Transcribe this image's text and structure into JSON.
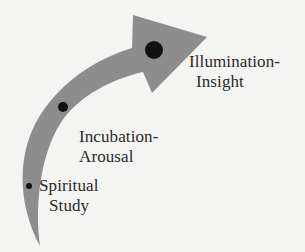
{
  "diagram": {
    "arrow": {
      "fill_color": "#8d8d8d",
      "direction": "curving up and to the right"
    },
    "stages": [
      {
        "label_line1": "Spiritual",
        "label_line2": "Study",
        "dot_size": "small"
      },
      {
        "label_line1": "Incubation-",
        "label_line2": "Arousal",
        "dot_size": "medium"
      },
      {
        "label_line1": "Illumination-",
        "label_line2": "Insight",
        "dot_size": "large"
      }
    ],
    "colors": {
      "background": "#f4f4f2",
      "arrow": "#8d8d8d",
      "dot": "#111111",
      "text": "#2a2a2a"
    }
  }
}
